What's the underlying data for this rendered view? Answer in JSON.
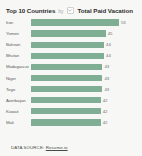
{
  "header": {
    "title_main": "Top 10 Countries",
    "title_by": "by",
    "title_metric": "Total Paid Vacation",
    "selector_icon": "chevron-down-icon"
  },
  "footer": {
    "source_label": "DATA SOURCE:",
    "source_link": "Resume.io"
  },
  "colors": {
    "bar": "#7fae95",
    "background": "#f7f7f5",
    "title": "#2e2e2e",
    "label": "#5c5c5c"
  },
  "chart_data": {
    "type": "bar",
    "orientation": "horizontal",
    "title": "Top 10 Countries by Total Paid Vacation",
    "xlabel": "",
    "ylabel": "",
    "grid": false,
    "legend": "none",
    "xlim": [
      0,
      53
    ],
    "categories": [
      "Iran",
      "Yemen",
      "Bahrain",
      "Bhutan",
      "Madagascar",
      "Niger",
      "Togo",
      "Azerbaijan",
      "Kuwait",
      "Mali"
    ],
    "values": [
      53,
      45,
      44,
      44,
      43,
      43,
      43,
      42,
      42,
      42
    ],
    "data_labels": [
      "53",
      "45",
      "44",
      "44",
      "43",
      "43",
      "43",
      "42",
      "42",
      "42"
    ]
  }
}
